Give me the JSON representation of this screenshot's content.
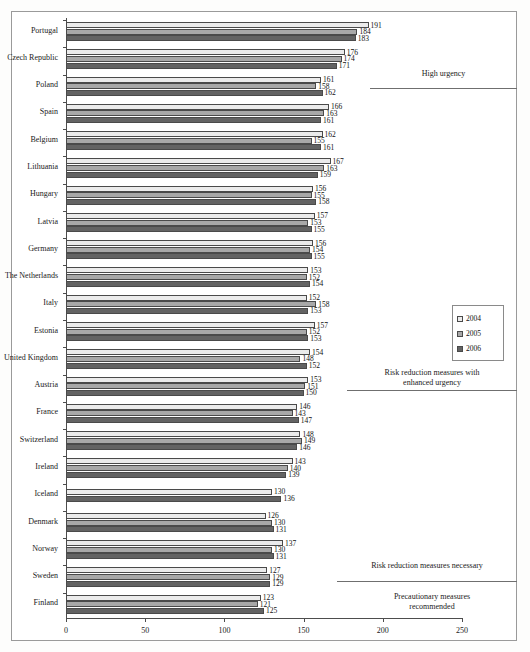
{
  "chart_data": {
    "type": "bar",
    "orientation": "horizontal",
    "title": "",
    "xlabel": "",
    "ylabel": "",
    "xlim": [
      0,
      250
    ],
    "xticks": [
      0,
      50,
      100,
      150,
      200,
      250
    ],
    "grid": false,
    "legend_position": "right",
    "categories": [
      "Portugal",
      "Czech Republic",
      "Poland",
      "Spain",
      "Belgium",
      "Lithuania",
      "Hungary",
      "Latvia",
      "Germany",
      "The Netherlands",
      "Italy",
      "Estonia",
      "United Kingdom",
      "Austria",
      "France",
      "Switzerland",
      "Ireland",
      "Iceland",
      "Denmark",
      "Norway",
      "Sweden",
      "Finland"
    ],
    "series": [
      {
        "name": "2004",
        "color": "#ebebeb",
        "values": [
          191,
          176,
          161,
          166,
          162,
          167,
          156,
          157,
          156,
          153,
          152,
          157,
          154,
          153,
          146,
          148,
          143,
          130,
          126,
          137,
          127,
          123
        ]
      },
      {
        "name": "2005",
        "color": "#a8a8a8",
        "values": [
          184,
          174,
          158,
          163,
          155,
          163,
          155,
          153,
          154,
          152,
          158,
          152,
          148,
          151,
          143,
          149,
          140,
          null,
          130,
          130,
          129,
          121
        ]
      },
      {
        "name": "2006",
        "color": "#636363",
        "values": [
          183,
          171,
          162,
          161,
          161,
          159,
          158,
          155,
          155,
          154,
          153,
          153,
          152,
          150,
          147,
          146,
          139,
          136,
          131,
          131,
          129,
          125
        ]
      }
    ],
    "annotations": [
      {
        "text": "High urgency",
        "line_y": 88
      },
      {
        "text": "Risk reduction measures with enhanced urgency",
        "line_y": 390
      },
      {
        "text": "Risk reduction measures necessary",
        "line_y": 581
      },
      {
        "text": "Precautionary measures recommended",
        "line_y": 652
      }
    ]
  },
  "legend": {
    "items": [
      {
        "label": "2004",
        "class": "s2004"
      },
      {
        "label": "2005",
        "class": "s2005"
      },
      {
        "label": "2006",
        "class": "s2006"
      }
    ]
  },
  "zones": [
    {
      "line1": "High urgency",
      "line2": ""
    },
    {
      "line1": "Risk reduction measures with",
      "line2": "enhanced urgency"
    },
    {
      "line1": "Risk reduction measures necessary",
      "line2": ""
    },
    {
      "line1": "Precautionary measures",
      "line2": "recommended"
    }
  ]
}
